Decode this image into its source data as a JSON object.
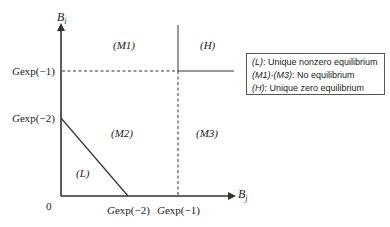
{
  "axes": {
    "y_label": "B",
    "y_label_sub": "i",
    "x_label": "B",
    "x_label_sub": "j",
    "origin_label": "0"
  },
  "y_ticks": [
    {
      "label": "Gexp(−1)",
      "prefix": "G",
      "suffix": "exp(−1)"
    },
    {
      "label": "Gexp(−2)",
      "prefix": "G",
      "suffix": "exp(−2)"
    }
  ],
  "x_ticks": [
    {
      "label": "Gexp(−2)",
      "prefix": "G",
      "suffix": "exp(−2)"
    },
    {
      "label": "Gexp(−1)",
      "prefix": "G",
      "suffix": "exp(−1)"
    }
  ],
  "regions": {
    "M1": "(M1)",
    "H": "(H)",
    "M2": "(M2)",
    "M3": "(M3)",
    "L": "(L)"
  },
  "legend": {
    "items": [
      {
        "key": "(L)",
        "text": ": Unique nonzero equilibrium"
      },
      {
        "key": "(M1)-(M3)",
        "text": ": No equilibrium"
      },
      {
        "key": "(H)",
        "text": ": Unique zero equilibrium"
      }
    ]
  },
  "colors": {
    "line": "#333333",
    "text": "#222222"
  }
}
